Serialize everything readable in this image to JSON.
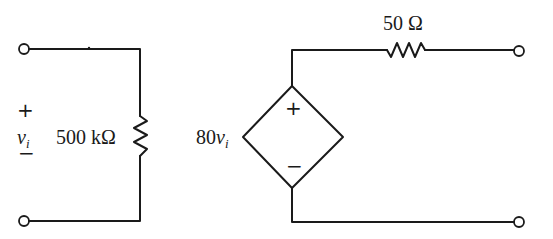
{
  "diagram": {
    "type": "circuit",
    "stroke_color": "#1a1a1a",
    "input_port": {
      "voltage_symbol": "v",
      "voltage_subscript": "i",
      "plus_sign": "+",
      "minus_sign": "−"
    },
    "input_resistor": {
      "label": "500 kΩ"
    },
    "dependent_source": {
      "shape": "diamond",
      "type": "voltage-controlled voltage source",
      "gain_value": "80",
      "control_symbol": "v",
      "control_subscript": "i",
      "plus_sign": "+",
      "minus_sign": "−"
    },
    "output_resistor": {
      "label": "50 Ω"
    },
    "terminals": [
      "input-top",
      "input-bottom",
      "output-top",
      "output-bottom"
    ]
  }
}
